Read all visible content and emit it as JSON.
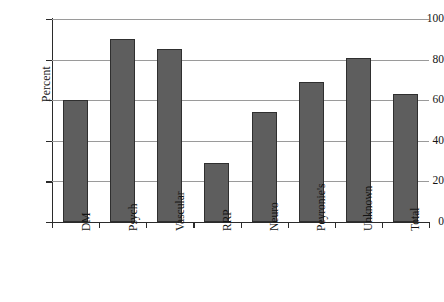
{
  "chart_data": {
    "type": "bar",
    "title": "",
    "xlabel": "",
    "ylabel": "Percent",
    "ylim": [
      0,
      100
    ],
    "ytick_labels": [
      "0",
      "20",
      "40",
      "60",
      "80",
      "100"
    ],
    "yticks": [
      0,
      20,
      40,
      60,
      80,
      100
    ],
    "grid": true,
    "legend": "none",
    "categories": [
      "DM",
      "Psych",
      "Vascular",
      "RRP",
      "Neuro",
      "Peyronie's",
      "Unknown",
      "Total"
    ],
    "values": [
      60,
      90,
      85,
      29,
      54,
      69,
      81,
      63
    ],
    "bar_color": "#5e5e5e",
    "bar_edge_color": "#2f2f2f",
    "grid_color": "#9a9a9a",
    "axis_color": "#2b2b2b",
    "background_color": "#ffffff"
  }
}
